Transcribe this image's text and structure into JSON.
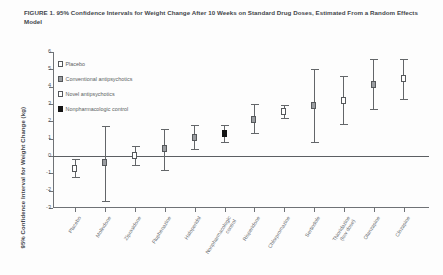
{
  "figure": {
    "title": "FIGURE 1. 95% Confidence Intervals for Weight Change After 10 Weeks on Standard Drug Doses, Estimated From a Random Effects Model"
  },
  "legend": {
    "position": "top-left-inside",
    "entries": [
      {
        "label": "Placebo",
        "style": "open"
      },
      {
        "label": "Conventional antipsychotics",
        "style": "gray"
      },
      {
        "label": "Novel antipsychotics",
        "style": "open"
      },
      {
        "label": "Nonpharmacologic control",
        "style": "black"
      }
    ]
  },
  "chart_data": {
    "type": "scatter",
    "title": "FIGURE 1. 95% Confidence Intervals for Weight Change After 10 Weeks on Standard Drug Doses, Estimated From a Random Effects Model",
    "xlabel": "",
    "ylabel": "95% Confidence Interval for Weight Change (kg)",
    "ylim": [
      -3,
      6
    ],
    "yticks": [
      6,
      5,
      4,
      3,
      2,
      1,
      0,
      -1,
      -2,
      -3
    ],
    "ytick_labels": [
      "6",
      "5",
      "4",
      "3",
      "2",
      "1",
      "0",
      "-1",
      "-2",
      "-3"
    ],
    "grid": false,
    "reference_line": 0,
    "categories": [
      "Placebo",
      "Molindone",
      "Ziprasidone",
      "Fluphenazine",
      "Haloperidol",
      "Nonpharmacologic control",
      "Risperidone",
      "Chlorpromazine",
      "Sertindole",
      "Thioridazine",
      "Olanzapine",
      "Clozapine"
    ],
    "category_lines": [
      [
        "Placebo"
      ],
      [
        "Molindone"
      ],
      [
        "Ziprasidone"
      ],
      [
        "Fluphenazine"
      ],
      [
        "Haloperidol"
      ],
      [
        "Nonpharmacologic",
        "control"
      ],
      [
        "Risperidone"
      ],
      [
        "Chlorpromazine"
      ],
      [
        "Sertindole"
      ],
      [
        "Thioridazine",
        "(low dose)"
      ],
      [
        "Olanzapine"
      ],
      [
        "Clozapine"
      ]
    ],
    "points": [
      {
        "category": "Placebo",
        "mean": -0.74,
        "ci_low": -1.2,
        "ci_high": -0.2,
        "style": "open"
      },
      {
        "category": "Molindone",
        "mean": -0.39,
        "ci_low": -2.6,
        "ci_high": 1.75,
        "style": "gray"
      },
      {
        "category": "Ziprasidone",
        "mean": 0.04,
        "ci_low": -0.5,
        "ci_high": 0.6,
        "style": "open"
      },
      {
        "category": "Fluphenazine",
        "mean": 0.43,
        "ci_low": -0.8,
        "ci_high": 1.55,
        "style": "gray"
      },
      {
        "category": "Haloperidol",
        "mean": 1.08,
        "ci_low": 0.4,
        "ci_high": 1.8,
        "style": "gray"
      },
      {
        "category": "Nonpharmacologic control",
        "mean": 1.3,
        "ci_low": 0.8,
        "ci_high": 1.8,
        "style": "black"
      },
      {
        "category": "Risperidone",
        "mean": 2.1,
        "ci_low": 1.3,
        "ci_high": 3.0,
        "style": "gray"
      },
      {
        "category": "Chlorpromazine",
        "mean": 2.58,
        "ci_low": 2.2,
        "ci_high": 2.95,
        "style": "open"
      },
      {
        "category": "Sertindole",
        "mean": 2.92,
        "ci_low": 0.8,
        "ci_high": 5.0,
        "style": "gray"
      },
      {
        "category": "Thioridazine",
        "mean": 3.19,
        "ci_low": 1.85,
        "ci_high": 4.6,
        "style": "open"
      },
      {
        "category": "Olanzapine",
        "mean": 4.15,
        "ci_low": 2.7,
        "ci_high": 5.6,
        "style": "gray"
      },
      {
        "category": "Clozapine",
        "mean": 4.45,
        "ci_low": 3.3,
        "ci_high": 5.6,
        "style": "open"
      }
    ],
    "series_styles": {
      "open": "Placebo / Novel antipsychotics (open square)",
      "gray": "Conventional antipsychotics (gray square)",
      "black": "Nonpharmacologic control (filled black square)"
    }
  }
}
